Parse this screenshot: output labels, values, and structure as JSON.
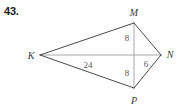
{
  "problem": {
    "number": "43."
  },
  "figure": {
    "type": "geometry-diagram",
    "shape_name": "kite-KMNP",
    "colors": {
      "edge": "#4a4a4a",
      "diagonal": "#a8a8a8",
      "vertex_label": "#3a3a3a",
      "measure_label": "#5a5a5a",
      "background": "#ffffff",
      "problem_number": "#1a1a1a"
    },
    "vertices": [
      {
        "id": "K",
        "label": "K",
        "x": 40,
        "y": 55,
        "label_x": 31,
        "label_y": 59
      },
      {
        "id": "M",
        "label": "M",
        "x": 134,
        "y": 23,
        "label_x": 134,
        "label_y": 16
      },
      {
        "id": "N",
        "label": "N",
        "x": 161,
        "y": 55,
        "label_x": 170,
        "label_y": 58
      },
      {
        "id": "P",
        "label": "P",
        "x": 134,
        "y": 88,
        "label_x": 134,
        "label_y": 104
      }
    ],
    "edges": [
      {
        "from": "K",
        "to": "M",
        "style": "solid-dark"
      },
      {
        "from": "M",
        "to": "N",
        "style": "solid-dark"
      },
      {
        "from": "N",
        "to": "P",
        "style": "solid-dark"
      },
      {
        "from": "P",
        "to": "K",
        "style": "solid-dark"
      }
    ],
    "diagonals": [
      {
        "from": "K",
        "to": "N",
        "style": "solid-light"
      },
      {
        "from": "M",
        "to": "P",
        "style": "solid-light"
      }
    ],
    "intersection": {
      "x": 134,
      "y": 55
    },
    "measures": [
      {
        "id": "KX",
        "value": "24",
        "x": 88,
        "y": 68,
        "segment": "K to intersection"
      },
      {
        "id": "MX",
        "value": "8",
        "x": 127,
        "y": 41,
        "segment": "M to intersection"
      },
      {
        "id": "XP",
        "value": "8",
        "x": 127,
        "y": 76,
        "segment": "intersection to P"
      },
      {
        "id": "XN",
        "value": "6",
        "x": 146,
        "y": 67,
        "segment": "intersection to N"
      }
    ]
  }
}
